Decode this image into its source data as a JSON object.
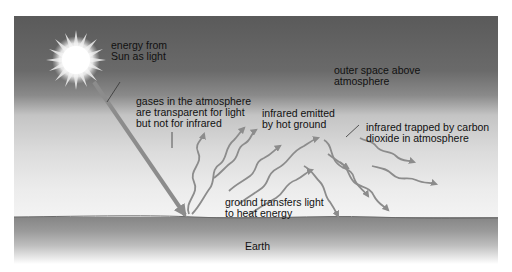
{
  "diagram": {
    "labels": {
      "sun_energy": "energy from\nSun as light",
      "gases_transparent": "gases in the atmosphere\nare transparent for light\nbut not for infrared",
      "infrared_emitted": "infrared emitted\nby hot ground",
      "outer_space": "outer space above\natmosphere",
      "infrared_trapped": "infrared trapped by carbon\ndioxide in atmosphere",
      "ground_transfers": "ground transfers light\nto heat energy",
      "earth": "Earth"
    },
    "colors": {
      "space": "#5a5a5a",
      "atmosphere": "#e6e6e6",
      "ground": "#8a8a8a",
      "arrow": "#8c8c8c",
      "sun": "#ffffff",
      "text": "#111111"
    }
  }
}
